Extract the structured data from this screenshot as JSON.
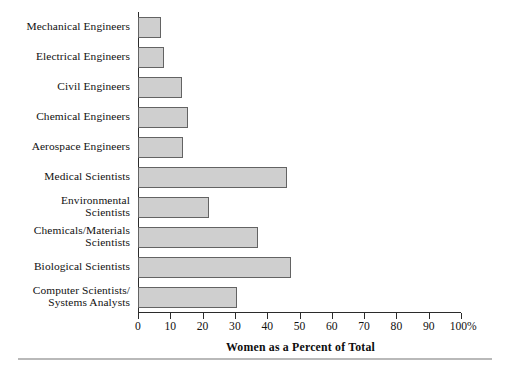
{
  "chart_data": {
    "type": "bar",
    "orientation": "horizontal",
    "title": "",
    "xlabel": "Women as a Percent of Total",
    "ylabel": "",
    "xlim": [
      0,
      100
    ],
    "xticks": [
      0,
      10,
      20,
      30,
      40,
      50,
      60,
      70,
      80,
      90,
      100
    ],
    "xtick_labels": [
      "0",
      "10",
      "20",
      "30",
      "40",
      "50",
      "60",
      "70",
      "80",
      "90",
      "100%"
    ],
    "grid": false,
    "legend": null,
    "bar_fill_color": "#cfcfcf",
    "bar_edge_color": "#636363",
    "categories": [
      "Mechanical Engineers",
      "Electrical Engineers",
      "Civil Engineers",
      "Chemical Engineers",
      "Aerospace Engineers",
      "Medical Scientists",
      "Environmental Scientists",
      "Chemicals/Materials Scientists",
      "Biological Scientists",
      "Computer Scientists/Systems Analysts"
    ],
    "category_label_lines": [
      [
        "Mechanical Engineers"
      ],
      [
        "Electrical Engineers"
      ],
      [
        "Civil Engineers"
      ],
      [
        "Chemical Engineers"
      ],
      [
        "Aerospace Engineers"
      ],
      [
        "Medical Scientists"
      ],
      [
        "Environmental",
        "Scientists"
      ],
      [
        "Chemicals/Materials",
        "Scientists"
      ],
      [
        "Biological Scientists"
      ],
      [
        "Computer Scientists/",
        "Systems Analysts"
      ]
    ],
    "values": [
      7,
      8,
      13.5,
      15.5,
      14,
      46,
      22,
      37,
      47.5,
      30.5
    ]
  }
}
